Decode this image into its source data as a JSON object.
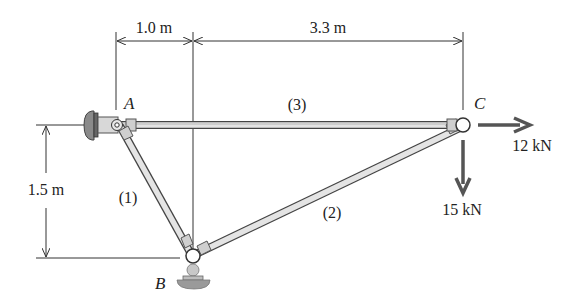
{
  "diagram": {
    "type": "truss",
    "dimensions": {
      "horizontal_1": "1.0 m",
      "horizontal_2": "3.3 m",
      "vertical": "1.5 m"
    },
    "joints": {
      "A": "A",
      "B": "B",
      "C": "C"
    },
    "members": {
      "m1": "(1)",
      "m2": "(2)",
      "m3": "(3)"
    },
    "loads": {
      "horizontal": "12 kN",
      "vertical": "15 kN"
    },
    "colors": {
      "member_fill": "#d8d8d8",
      "member_outline": "#555555",
      "arrow": "#555555",
      "ground": "#8a8a8a"
    }
  }
}
